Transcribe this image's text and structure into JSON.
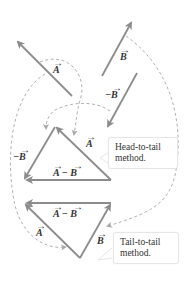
{
  "figure": {
    "colors": {
      "vector": "#8c8c8c",
      "dashed": "#a8a8a8",
      "text": "#333333"
    },
    "labels": {
      "vec_a": "A",
      "vec_b": "B",
      "neg_b": "−B",
      "a_minus_b": "A − B"
    },
    "callouts": {
      "head_to_tail": {
        "line1": "Head-to-tail",
        "line2": "method."
      },
      "tail_to_tail": {
        "line1": "Tail-to-tail",
        "line2": "method."
      }
    }
  }
}
